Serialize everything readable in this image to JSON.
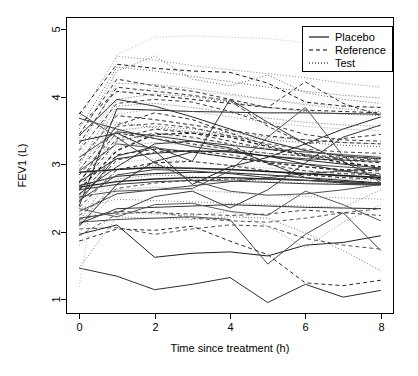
{
  "chart_data": {
    "type": "line",
    "title": "",
    "subtitle": "",
    "xlabel": "Time since treatment (h)",
    "ylabel": "FEV1 (L)",
    "xlim": [
      -0.35,
      8.35
    ],
    "ylim": [
      0.78,
      5.18
    ],
    "xticks": [
      0,
      2,
      4,
      6,
      8
    ],
    "xticklabels": [
      "0",
      "2",
      "4",
      "6",
      "8"
    ],
    "yticks": [
      1,
      2,
      3,
      4,
      5
    ],
    "yticklabels": [
      "1",
      "2",
      "3",
      "4",
      "5"
    ],
    "grid": false,
    "legend_position": "top-right",
    "legend": [
      {
        "label": "Placebo",
        "dash": "none",
        "style": "solid"
      },
      {
        "label": "Reference",
        "dash": "4,3",
        "style": "dashed"
      },
      {
        "label": "Test",
        "dash": "1,2",
        "style": "dotted"
      }
    ],
    "x": [
      0,
      1,
      2,
      3,
      4,
      5,
      6,
      7,
      8
    ],
    "series": [
      {
        "name": "Placebo-01",
        "group": "Placebo",
        "color": "#1a1a1a",
        "width": 1.0,
        "values": [
          2.68,
          2.82,
          2.86,
          2.88,
          2.87,
          2.84,
          2.8,
          2.76,
          2.72
        ]
      },
      {
        "name": "Placebo-02",
        "group": "Placebo",
        "color": "#1a1a1a",
        "width": 1.6,
        "values": [
          2.88,
          2.92,
          2.95,
          2.94,
          2.92,
          2.89,
          2.86,
          2.83,
          2.8
        ]
      },
      {
        "name": "Placebo-03",
        "group": "Placebo",
        "color": "#333333",
        "width": 1.0,
        "values": [
          2.62,
          2.7,
          2.74,
          2.76,
          2.75,
          2.73,
          2.71,
          2.7,
          2.69
        ]
      },
      {
        "name": "Placebo-04",
        "group": "Placebo",
        "color": "#2b2b2b",
        "width": 1.0,
        "values": [
          3.42,
          3.96,
          3.86,
          3.7,
          3.52,
          3.34,
          3.2,
          3.12,
          3.08
        ]
      },
      {
        "name": "Placebo-05",
        "group": "Placebo",
        "color": "#404040",
        "width": 1.0,
        "values": [
          3.68,
          3.52,
          3.38,
          3.26,
          3.18,
          3.12,
          3.08,
          3.06,
          3.04
        ]
      },
      {
        "name": "Placebo-06",
        "group": "Placebo",
        "color": "#262626",
        "width": 1.0,
        "values": [
          2.38,
          3.82,
          3.8,
          3.78,
          3.77,
          3.76,
          3.76,
          3.75,
          3.74
        ]
      },
      {
        "name": "Placebo-07",
        "group": "Placebo",
        "color": "#555555",
        "width": 1.0,
        "values": [
          2.52,
          2.6,
          2.62,
          2.64,
          2.9,
          3.4,
          3.84,
          3.12,
          2.72
        ]
      },
      {
        "name": "Placebo-08",
        "group": "Placebo",
        "color": "#303030",
        "width": 1.0,
        "values": [
          2.12,
          2.34,
          2.36,
          2.38,
          2.4,
          2.38,
          2.36,
          2.35,
          2.34
        ]
      },
      {
        "name": "Placebo-09",
        "group": "Placebo",
        "color": "#3a3a3a",
        "width": 1.0,
        "values": [
          2.2,
          2.28,
          2.52,
          2.6,
          2.35,
          2.62,
          3.02,
          3.4,
          3.58
        ]
      },
      {
        "name": "Placebo-10",
        "group": "Placebo",
        "color": "#1f1f1f",
        "width": 1.0,
        "values": [
          1.96,
          2.1,
          1.62,
          1.68,
          1.7,
          1.64,
          1.8,
          1.84,
          1.94
        ]
      },
      {
        "name": "Placebo-11",
        "group": "Placebo",
        "color": "#2e2e2e",
        "width": 1.0,
        "values": [
          1.46,
          1.34,
          1.14,
          1.22,
          1.32,
          0.95,
          1.22,
          1.03,
          1.13
        ]
      },
      {
        "name": "Placebo-12",
        "group": "Placebo",
        "color": "#474747",
        "width": 1.0,
        "values": [
          2.14,
          2.18,
          2.2,
          2.22,
          2.18,
          1.52,
          1.96,
          2.28,
          1.72
        ]
      },
      {
        "name": "Placebo-13",
        "group": "Placebo",
        "color": "#222222",
        "width": 1.0,
        "values": [
          3.34,
          3.46,
          3.2,
          2.7,
          2.96,
          3.1,
          3.3,
          3.52,
          3.7
        ]
      },
      {
        "name": "Placebo-14",
        "group": "Placebo",
        "color": "#383838",
        "width": 1.0,
        "values": [
          2.44,
          3.12,
          3.26,
          3.04,
          3.96,
          3.62,
          3.3,
          3.04,
          2.76
        ]
      },
      {
        "name": "Placebo-15",
        "group": "Placebo",
        "color": "#4a4a4a",
        "width": 1.0,
        "values": [
          2.9,
          3.3,
          3.24,
          3.18,
          3.1,
          3.04,
          3.0,
          2.96,
          2.92
        ]
      },
      {
        "name": "Placebo-16",
        "group": "Placebo",
        "color": "#2a2a2a",
        "width": 1.0,
        "values": [
          2.74,
          3.08,
          3.16,
          3.2,
          3.18,
          3.12,
          3.06,
          3.0,
          2.94
        ]
      },
      {
        "name": "Placebo-17",
        "group": "Placebo",
        "color": "#353535",
        "width": 1.0,
        "values": [
          3.1,
          3.48,
          3.42,
          3.34,
          3.28,
          3.22,
          3.18,
          3.14,
          3.1
        ]
      },
      {
        "name": "Placebo-18",
        "group": "Placebo",
        "color": "#444444",
        "width": 1.0,
        "values": [
          2.3,
          2.56,
          2.62,
          2.68,
          2.74,
          2.8,
          2.86,
          2.9,
          2.94
        ]
      },
      {
        "name": "Placebo-19",
        "group": "Placebo",
        "color": "#202020",
        "width": 1.3,
        "values": [
          2.66,
          2.74,
          2.78,
          2.8,
          2.8,
          2.78,
          2.76,
          2.74,
          2.72
        ]
      },
      {
        "name": "Placebo-20",
        "group": "Placebo",
        "color": "#505050",
        "width": 1.0,
        "values": [
          3.76,
          3.4,
          3.02,
          2.76,
          2.6,
          2.54,
          2.56,
          2.62,
          2.7
        ]
      },
      {
        "name": "Placebo-21",
        "group": "Placebo",
        "color": "#2c2c2c",
        "width": 1.0,
        "values": [
          2.56,
          2.96,
          3.3,
          3.34,
          3.24,
          3.02,
          2.8,
          2.72,
          2.7
        ]
      },
      {
        "name": "Placebo-22",
        "group": "Placebo",
        "color": "#3e3e3e",
        "width": 1.0,
        "values": [
          2.46,
          2.84,
          2.92,
          2.9,
          2.86,
          2.8,
          2.76,
          2.72,
          2.7
        ]
      },
      {
        "name": "Placebo-23",
        "group": "Placebo",
        "color": "#262626",
        "width": 1.0,
        "values": [
          2.08,
          2.7,
          3.04,
          3.18,
          3.2,
          3.12,
          3.0,
          2.9,
          2.82
        ]
      },
      {
        "name": "Placebo-24",
        "group": "Placebo",
        "color": "#585858",
        "width": 1.0,
        "values": [
          2.34,
          2.22,
          2.4,
          2.42,
          2.3,
          2.24,
          2.6,
          2.4,
          2.16
        ]
      },
      {
        "name": "Reference-01",
        "group": "Reference",
        "color": "#1a1a1a",
        "width": 1.0,
        "values": [
          3.74,
          4.48,
          4.42,
          4.38,
          4.36,
          4.2,
          3.92,
          3.86,
          3.84
        ]
      },
      {
        "name": "Reference-02",
        "group": "Reference",
        "color": "#2b2b2b",
        "width": 1.0,
        "values": [
          3.44,
          4.26,
          4.16,
          4.08,
          3.96,
          3.84,
          4.22,
          3.9,
          3.72
        ]
      },
      {
        "name": "Reference-03",
        "group": "Reference",
        "color": "#333333",
        "width": 1.0,
        "values": [
          3.3,
          4.14,
          4.08,
          4.02,
          3.94,
          3.56,
          3.3,
          3.38,
          3.44
        ]
      },
      {
        "name": "Reference-04",
        "group": "Reference",
        "color": "#3d3d3d",
        "width": 1.0,
        "values": [
          3.2,
          3.9,
          3.96,
          3.92,
          3.78,
          3.6,
          3.44,
          3.36,
          3.34
        ]
      },
      {
        "name": "Reference-05",
        "group": "Reference",
        "color": "#242424",
        "width": 1.4,
        "values": [
          2.62,
          3.2,
          3.44,
          3.46,
          3.4,
          3.26,
          3.12,
          3.02,
          2.96
        ]
      },
      {
        "name": "Reference-06",
        "group": "Reference",
        "color": "#4a4a4a",
        "width": 1.0,
        "values": [
          2.92,
          3.56,
          3.6,
          3.54,
          3.42,
          3.3,
          3.22,
          3.18,
          3.16
        ]
      },
      {
        "name": "Reference-07",
        "group": "Reference",
        "color": "#2e2e2e",
        "width": 1.0,
        "values": [
          2.74,
          3.38,
          3.52,
          3.46,
          3.34,
          3.22,
          3.14,
          3.1,
          3.08
        ]
      },
      {
        "name": "Reference-08",
        "group": "Reference",
        "color": "#383838",
        "width": 1.0,
        "values": [
          2.48,
          3.06,
          3.18,
          3.2,
          3.14,
          3.04,
          2.96,
          2.9,
          2.86
        ]
      },
      {
        "name": "Reference-09",
        "group": "Reference",
        "color": "#202020",
        "width": 1.0,
        "values": [
          2.36,
          2.92,
          3.02,
          3.04,
          2.98,
          2.9,
          2.84,
          2.8,
          2.78
        ]
      },
      {
        "name": "Reference-10",
        "group": "Reference",
        "color": "#505050",
        "width": 1.0,
        "values": [
          2.04,
          2.06,
          1.96,
          2.04,
          2.1,
          2.08,
          1.9,
          1.8,
          1.74
        ]
      },
      {
        "name": "Reference-11",
        "group": "Reference",
        "color": "#2a2a2a",
        "width": 1.0,
        "values": [
          1.86,
          2.04,
          2.02,
          2.08,
          1.86,
          1.66,
          1.24,
          1.2,
          1.28
        ]
      },
      {
        "name": "Reference-12",
        "group": "Reference",
        "color": "#444444",
        "width": 1.0,
        "values": [
          2.18,
          2.3,
          2.28,
          2.26,
          2.24,
          2.26,
          2.32,
          2.28,
          2.24
        ]
      },
      {
        "name": "Reference-13",
        "group": "Reference",
        "color": "#363636",
        "width": 1.0,
        "values": [
          2.66,
          3.34,
          3.46,
          3.4,
          3.3,
          3.0,
          2.9,
          2.86,
          2.84
        ]
      },
      {
        "name": "Reference-14",
        "group": "Reference",
        "color": "#1f1f1f",
        "width": 1.0,
        "values": [
          3.58,
          4.08,
          4.02,
          3.96,
          3.9,
          3.84,
          3.8,
          3.78,
          3.76
        ]
      },
      {
        "name": "Reference-15",
        "group": "Reference",
        "color": "#4e4e4e",
        "width": 1.0,
        "values": [
          2.24,
          2.64,
          2.72,
          2.76,
          2.78,
          2.78,
          2.76,
          2.74,
          2.72
        ]
      },
      {
        "name": "Reference-16",
        "group": "Reference",
        "color": "#2c2c2c",
        "width": 1.0,
        "values": [
          3.04,
          3.72,
          3.66,
          3.58,
          3.5,
          3.42,
          3.36,
          3.32,
          3.3
        ]
      },
      {
        "name": "Reference-17",
        "group": "Reference",
        "color": "#3a3a3a",
        "width": 1.0,
        "values": [
          2.84,
          3.46,
          3.38,
          3.3,
          3.22,
          3.16,
          3.12,
          3.08,
          3.06
        ]
      },
      {
        "name": "Reference-18",
        "group": "Reference",
        "color": "#272727",
        "width": 1.0,
        "values": [
          2.54,
          3.14,
          3.22,
          3.18,
          3.1,
          3.02,
          2.96,
          2.92,
          2.9
        ]
      },
      {
        "name": "Reference-19",
        "group": "Reference",
        "color": "#565656",
        "width": 1.0,
        "values": [
          1.94,
          2.26,
          2.3,
          2.2,
          2.16,
          2.14,
          2.2,
          2.28,
          2.34
        ]
      },
      {
        "name": "Reference-20",
        "group": "Reference",
        "color": "#303030",
        "width": 1.0,
        "values": [
          2.72,
          3.58,
          3.76,
          3.66,
          3.46,
          3.28,
          3.14,
          3.06,
          3.02
        ]
      },
      {
        "name": "Test-01",
        "group": "Test",
        "color": "#c0c0c0",
        "width": 1.0,
        "values": [
          1.18,
          4.62,
          4.88,
          4.9,
          4.88,
          4.86,
          4.8,
          4.54,
          4.42
        ]
      },
      {
        "name": "Test-02",
        "group": "Test",
        "color": "#888888",
        "width": 1.0,
        "values": [
          3.68,
          4.6,
          4.54,
          4.46,
          4.4,
          4.34,
          4.28,
          4.2,
          4.14
        ]
      },
      {
        "name": "Test-03",
        "group": "Test",
        "color": "#6a6a6a",
        "width": 1.0,
        "values": [
          3.38,
          4.38,
          4.6,
          4.26,
          4.16,
          4.32,
          4.06,
          3.96,
          3.9
        ]
      },
      {
        "name": "Test-04",
        "group": "Test",
        "color": "#7c7c7c",
        "width": 1.0,
        "values": [
          3.22,
          4.2,
          4.18,
          4.12,
          4.04,
          3.96,
          3.88,
          3.82,
          3.78
        ]
      },
      {
        "name": "Test-05",
        "group": "Test",
        "color": "#5e5e5e",
        "width": 1.0,
        "values": [
          2.98,
          3.96,
          4.04,
          4.0,
          3.92,
          3.84,
          3.78,
          3.74,
          3.72
        ]
      },
      {
        "name": "Test-06",
        "group": "Test",
        "color": "#9a9a9a",
        "width": 1.0,
        "values": [
          2.8,
          3.74,
          3.82,
          3.78,
          3.7,
          3.62,
          3.56,
          3.52,
          3.5
        ]
      },
      {
        "name": "Test-07",
        "group": "Test",
        "color": "#707070",
        "width": 1.0,
        "values": [
          2.6,
          3.5,
          3.56,
          3.52,
          3.46,
          3.4,
          3.36,
          3.32,
          3.3
        ]
      },
      {
        "name": "Test-08",
        "group": "Test",
        "color": "#848484",
        "width": 1.0,
        "values": [
          2.42,
          3.26,
          3.32,
          3.28,
          3.22,
          3.16,
          3.12,
          3.1,
          3.08
        ]
      },
      {
        "name": "Test-09",
        "group": "Test",
        "color": "#a6a6a6",
        "width": 1.0,
        "values": [
          2.26,
          3.02,
          3.08,
          3.04,
          2.98,
          2.94,
          2.9,
          2.88,
          2.86
        ]
      },
      {
        "name": "Test-10",
        "group": "Test",
        "color": "#666666",
        "width": 1.0,
        "values": [
          2.1,
          2.78,
          2.84,
          2.82,
          2.78,
          2.74,
          2.72,
          2.7,
          2.68
        ]
      },
      {
        "name": "Test-11",
        "group": "Test",
        "color": "#949494",
        "width": 1.0,
        "values": [
          1.8,
          2.28,
          2.26,
          2.24,
          2.3,
          2.08,
          1.76,
          2.14,
          2.4
        ]
      },
      {
        "name": "Test-12",
        "group": "Test",
        "color": "#787878",
        "width": 1.0,
        "values": [
          1.46,
          2.22,
          2.2,
          2.18,
          2.22,
          2.2,
          1.98,
          1.72,
          1.42
        ]
      },
      {
        "name": "Test-13",
        "group": "Test",
        "color": "#5a5a5a",
        "width": 1.0,
        "values": [
          2.7,
          3.62,
          3.54,
          3.48,
          3.42,
          3.36,
          3.32,
          3.28,
          3.26
        ]
      },
      {
        "name": "Test-14",
        "group": "Test",
        "color": "#b0b0b0",
        "width": 1.0,
        "values": [
          3.1,
          4.06,
          4.12,
          4.08,
          4.02,
          3.96,
          3.9,
          3.86,
          3.84
        ]
      },
      {
        "name": "Test-15",
        "group": "Test",
        "color": "#828282",
        "width": 1.0,
        "values": [
          2.34,
          2.48,
          2.46,
          2.44,
          2.42,
          2.4,
          2.38,
          2.36,
          2.62
        ]
      },
      {
        "name": "Test-16",
        "group": "Test",
        "color": "#6e6e6e",
        "width": 1.0,
        "values": [
          2.88,
          3.86,
          3.9,
          3.84,
          3.76,
          3.68,
          3.62,
          3.58,
          3.56
        ]
      },
      {
        "name": "Test-17",
        "group": "Test",
        "color": "#9e9e9e",
        "width": 1.0,
        "values": [
          2.5,
          3.36,
          3.42,
          3.38,
          3.3,
          3.24,
          3.18,
          3.14,
          3.12
        ]
      },
      {
        "name": "Test-18",
        "group": "Test",
        "color": "#747474",
        "width": 1.0,
        "values": [
          2.16,
          2.92,
          2.98,
          2.94,
          2.88,
          2.84,
          2.8,
          2.78,
          2.76
        ]
      },
      {
        "name": "Test-19",
        "group": "Test",
        "color": "#8e8e8e",
        "width": 1.0,
        "values": [
          1.98,
          2.62,
          2.66,
          2.62,
          2.58,
          2.54,
          2.52,
          2.5,
          2.48
        ]
      },
      {
        "name": "Test-20",
        "group": "Test",
        "color": "#626262",
        "width": 1.0,
        "values": [
          3.52,
          4.44,
          4.38,
          4.3,
          4.22,
          4.14,
          4.08,
          4.02,
          3.98
        ]
      }
    ]
  }
}
